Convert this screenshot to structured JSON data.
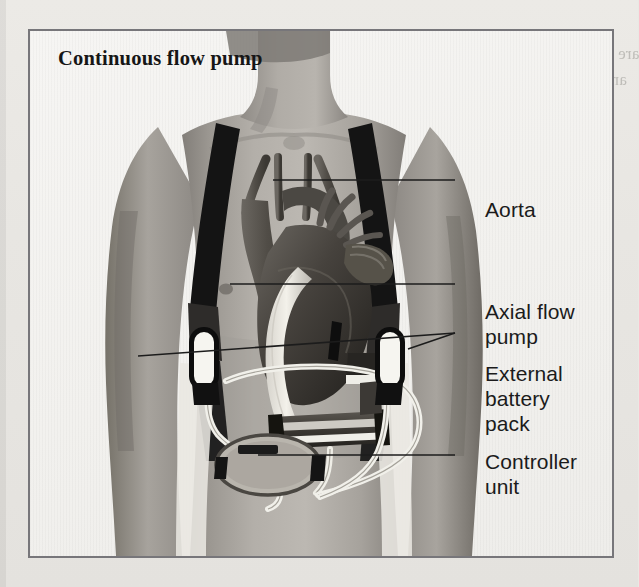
{
  "page": {
    "background_color": "#e9e8e4",
    "bleed_through_lines": [
      {
        "text": "are an elective emergency problem",
        "x": 392,
        "y": 44
      },
      {
        "text": "and in our experience a ventricular",
        "x": 380,
        "y": 70
      },
      {
        "text": "myocardial infarction.",
        "x": 372,
        "y": 96
      },
      {
        "text": "If a patient cannot be weaned from",
        "x": 366,
        "y": 122
      },
      {
        "text": "bypass, a",
        "x": 392,
        "y": 148
      },
      {
        "text": "ventricular assist device",
        "x": 370,
        "y": 174
      },
      {
        "text": "may be",
        "x": 388,
        "y": 200
      },
      {
        "text": "implanted as a",
        "x": 376,
        "y": 226
      },
      {
        "text": "bridge to transplantation",
        "x": 366,
        "y": 252
      },
      {
        "text": "in selected patients.",
        "x": 380,
        "y": 278
      },
      {
        "text": "Implantation of an assist device",
        "x": 370,
        "y": 304
      },
      {
        "text": "may be indicated in a patient",
        "x": 374,
        "y": 330
      },
      {
        "text": "with severe heart failure whose",
        "x": 368,
        "y": 356
      },
      {
        "text": "myocardium may recover",
        "x": 378,
        "y": 382
      },
      {
        "text": "over days or weeks.",
        "x": 384,
        "y": 408
      },
      {
        "text": "Heart and lung transplantation",
        "x": 366,
        "y": 462
      },
      {
        "text": "Cardiac transplantation",
        "x": 374,
        "y": 492
      },
      {
        "text": "with severe heart failure",
        "x": 30,
        "y": 150
      },
      {
        "text": "and some patients",
        "x": 38,
        "y": 188
      },
      {
        "text": "the severity of",
        "x": 44,
        "y": 226
      },
      {
        "text": "a full assessment",
        "x": 36,
        "y": 300
      },
      {
        "text": "of cardiac function",
        "x": 34,
        "y": 338
      },
      {
        "text": "may be required",
        "x": 40,
        "y": 376
      }
    ]
  },
  "figure": {
    "title": "Continuous flow pump",
    "border_color": "#77767a",
    "background_color": "#f4f3f1",
    "labels": [
      {
        "id": "aorta",
        "text": "Aorta",
        "x": 455,
        "y": 166
      },
      {
        "id": "axial",
        "text": "Axial flow\npump",
        "x": 455,
        "y": 268
      },
      {
        "id": "battery",
        "text": "External\nbattery\npack",
        "x": 455,
        "y": 330
      },
      {
        "id": "controller",
        "text": "Controller\nunit",
        "x": 455,
        "y": 418
      }
    ],
    "leader_lines": [
      {
        "for": "aorta",
        "from": [
          243,
          149
        ],
        "to": [
          425,
          149
        ]
      },
      {
        "for": "axial",
        "from": [
          200,
          253
        ],
        "to": [
          425,
          253
        ]
      },
      {
        "for": "battery",
        "from": [
          108,
          325
        ],
        "to": [
          425,
          302
        ]
      },
      {
        "for": "battery_2",
        "from": [
          378,
          318
        ],
        "to": [
          425,
          302
        ]
      },
      {
        "for": "controller",
        "from": [
          228,
          424
        ],
        "to": [
          425,
          424
        ]
      }
    ],
    "anatomy": {
      "aorta_label": "aorta-and-arch",
      "heart_label": "heart",
      "pump_label": "axial-flow-pump-device",
      "graft_label": "outflow-graft",
      "driveline_label": "percutaneous-driveline",
      "battery_left_label": "external-battery-pack-left",
      "battery_right_label": "external-battery-pack-right",
      "controller_label": "controller-unit",
      "strap_label": "shoulder-harness-strap"
    },
    "skin_tone": "#a8a49f",
    "skin_shadow": "#837f7b",
    "device_dark": "#1a1a1a",
    "device_light": "#f2f1ec"
  }
}
